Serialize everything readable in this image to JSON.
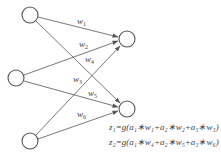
{
  "diagram": {
    "type": "neural-network",
    "input_nodes": [
      {
        "id": "a1",
        "cx": 30,
        "cy": 15
      },
      {
        "id": "a2",
        "cx": 16,
        "cy": 78
      },
      {
        "id": "a3",
        "cx": 30,
        "cy": 141
      }
    ],
    "output_nodes": [
      {
        "id": "z1",
        "cx": 127,
        "cy": 39
      },
      {
        "id": "z2",
        "cx": 127,
        "cy": 109
      }
    ],
    "edges": [
      {
        "from": "a1",
        "to": "z1",
        "label": "w",
        "sub": "1"
      },
      {
        "from": "a2",
        "to": "z1",
        "label": "w",
        "sub": "2"
      },
      {
        "from": "a1",
        "to": "z2",
        "label": "w",
        "sub": "4"
      },
      {
        "from": "a3",
        "to": "z1",
        "label": "w",
        "sub": "3"
      },
      {
        "from": "a2",
        "to": "z2",
        "label": "w",
        "sub": "5"
      },
      {
        "from": "a3",
        "to": "z2",
        "label": "w",
        "sub": "6"
      }
    ],
    "weight_labels": {
      "w1": "w1",
      "w2": "w2",
      "w3": "w3",
      "w4": "w4",
      "w5": "w5",
      "w6": "w6"
    },
    "equations": {
      "z1": "z₁=g(a₁∗w₁+a₂∗w₂+a₃∗w₃)",
      "z2": "z₂=g(a₁∗w₄+a₂∗w₅+a₃∗w₆)"
    }
  }
}
